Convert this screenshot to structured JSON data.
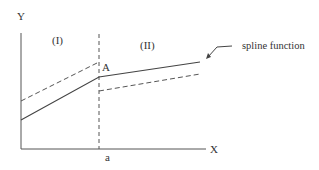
{
  "diagram": {
    "axes": {
      "y_label": "Y",
      "x_label": "X",
      "x_tick_label": "a"
    },
    "regions": {
      "left": "(I)",
      "right": "(II)"
    },
    "point_label": "A",
    "annotation": "spline function",
    "colors": {
      "line": "#444444",
      "text": "#333333",
      "background": "#ffffff"
    }
  }
}
